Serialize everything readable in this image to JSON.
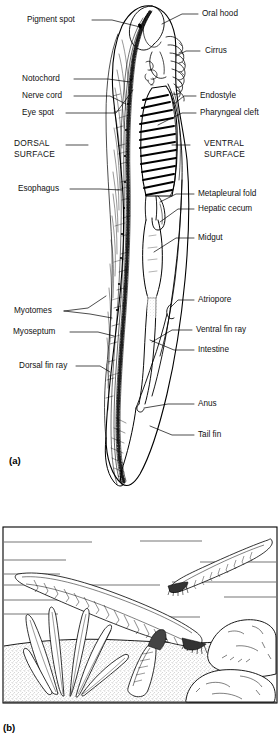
{
  "figure": {
    "panels": [
      {
        "id": "a",
        "letter": "(a)",
        "description": "Labeled internal anatomy, lateral view"
      },
      {
        "id": "b",
        "letter": "(b)",
        "description": "Lancelets in natural habitat among sand, plants and rocks"
      }
    ]
  },
  "panel_a": {
    "letter": "(a)",
    "labels_left": [
      {
        "name": "pigment-spot",
        "text": "Pigment spot",
        "x": 27,
        "y": 16
      },
      {
        "name": "notochord",
        "text": "Notochord",
        "x": 22,
        "y": 74
      },
      {
        "name": "nerve-cord",
        "text": "Nerve cord",
        "x": 22,
        "y": 91
      },
      {
        "name": "eye-spot",
        "text": "Eye spot",
        "x": 22,
        "y": 108
      },
      {
        "name": "esophagus",
        "text": "Esophagus",
        "x": 18,
        "y": 184
      },
      {
        "name": "myotomes",
        "text": "Myotomes",
        "x": 14,
        "y": 307
      },
      {
        "name": "myoseptum",
        "text": "Myoseptum",
        "x": 13,
        "y": 327
      },
      {
        "name": "dorsal-fin-ray",
        "text": "Dorsal fin ray",
        "x": 19,
        "y": 361
      }
    ],
    "labels_right": [
      {
        "name": "oral-hood",
        "text": "Oral hood",
        "x": 202,
        "y": 10
      },
      {
        "name": "cirrus",
        "text": "Cirrus",
        "x": 205,
        "y": 47
      },
      {
        "name": "endostyle",
        "text": "Endostyle",
        "x": 200,
        "y": 91
      },
      {
        "name": "pharyngeal-cleft",
        "text": "Pharyngeal cleft",
        "x": 200,
        "y": 108
      },
      {
        "name": "metapleural-fold",
        "text": "Metapleural fold",
        "x": 198,
        "y": 189
      },
      {
        "name": "hepatic-cecum",
        "text": "Hepatic cecum",
        "x": 198,
        "y": 204
      },
      {
        "name": "midgut",
        "text": "Midgut",
        "x": 198,
        "y": 233
      },
      {
        "name": "atriopore",
        "text": "Atriopore",
        "x": 198,
        "y": 295
      },
      {
        "name": "ventral-fin-ray",
        "text": "Ventral fin ray",
        "x": 196,
        "y": 325
      },
      {
        "name": "intestine",
        "text": "Intestine",
        "x": 198,
        "y": 345
      },
      {
        "name": "anus",
        "text": "Anus",
        "x": 198,
        "y": 399
      },
      {
        "name": "tail-fin",
        "text": "Tail fin",
        "x": 198,
        "y": 430
      }
    ],
    "surface_labels": [
      {
        "name": "dorsal-surface",
        "line1": "DORSAL",
        "line2": "SURFACE",
        "x": 14,
        "y": 140
      },
      {
        "name": "ventral-surface",
        "line1": "VENTRAL",
        "line2": "SURFACE",
        "x": 204,
        "y": 140
      }
    ]
  },
  "panel_b": {
    "letter": "(b)",
    "scene_elements": [
      "swimming-lancelet-large",
      "swimming-lancelet-small",
      "burrowing-lancelet",
      "seagrass-plant",
      "rock-large",
      "rock-small",
      "sandy-substrate",
      "water-background"
    ]
  },
  "colors": {
    "ink": "#000000",
    "paper": "#ffffff",
    "shading": "#8a8a8a"
  }
}
